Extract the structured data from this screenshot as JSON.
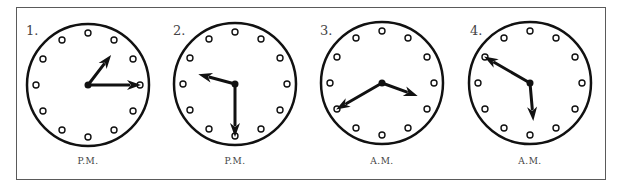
{
  "figure": {
    "clocks": [
      {
        "number": "1.",
        "period": "P.M.",
        "hour": 1,
        "minute": 15,
        "cx": 88,
        "cy": 85
      },
      {
        "number": "2.",
        "period": "P.M.",
        "hour": 9,
        "minute": 30,
        "cx": 235,
        "cy": 84
      },
      {
        "number": "3.",
        "period": "A.M.",
        "hour": 3,
        "minute": 40,
        "cx": 382,
        "cy": 83
      },
      {
        "number": "4.",
        "period": "A.M.",
        "hour": 5,
        "minute": 50,
        "cx": 530,
        "cy": 83
      }
    ],
    "colors": {
      "ink": "#111111",
      "frame": "#5a5a5a",
      "label": "#444444"
    }
  }
}
